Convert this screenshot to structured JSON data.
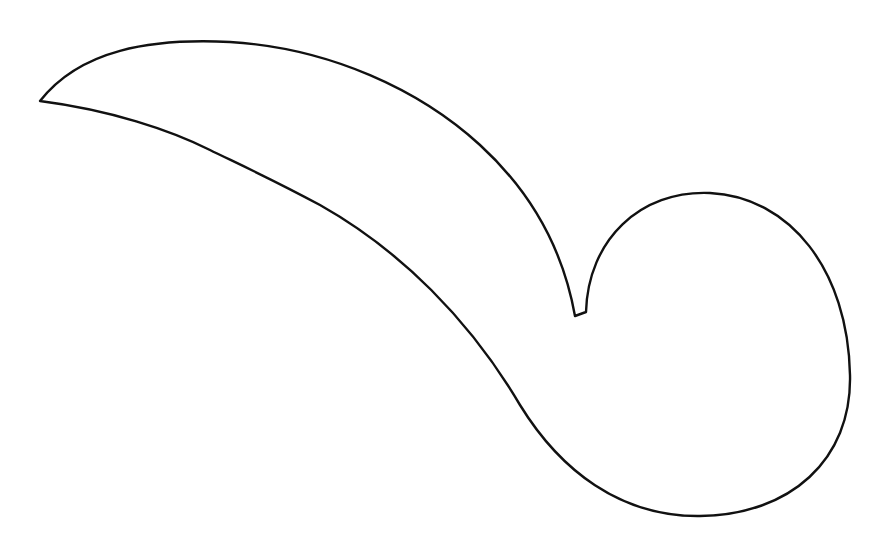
{
  "figure": {
    "background_color": "#ffffff",
    "stroke_color": "#111111",
    "stroke_width": 2.4,
    "shape_path": "M 40 101 C 80 50, 150 38, 230 42 C 330 48, 420 90, 480 145 C 540 200, 565 260, 575 316 L 586 312 C 588 240, 640 190, 710 193 C 790 197, 848 270, 850 375 C 852 460, 790 515, 700 516 C 620 517, 560 470, 520 405 C 470 320, 400 250, 320 205 C 270 178, 230 160, 210 150 C 170 130, 110 110, 40 101 Z"
  }
}
